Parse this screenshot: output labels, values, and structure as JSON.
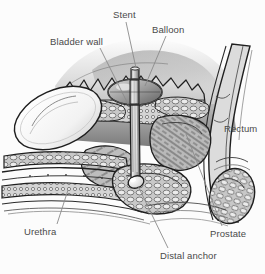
{
  "figure": {
    "background_color": "#fcfcfc",
    "ink_color": "#2b2b2b",
    "label_color": "#4a4a4a",
    "leader_color": "#8a8a8a"
  },
  "labels": {
    "stent": "Stent",
    "balloon": "Balloon",
    "bladder_wall": "Bladder wall",
    "rectum": "Rectum",
    "urethra": "Urethra",
    "prostate": "Prostate",
    "distal_anchor": "Distal anchor"
  },
  "structures": [
    {
      "name": "bladder-wall",
      "label": "Bladder wall"
    },
    {
      "name": "stent",
      "label": "Stent"
    },
    {
      "name": "balloon",
      "label": "Balloon"
    },
    {
      "name": "rectum",
      "label": "Rectum"
    },
    {
      "name": "prostate",
      "label": "Prostate"
    },
    {
      "name": "urethra",
      "label": "Urethra"
    },
    {
      "name": "distal-anchor",
      "label": "Distal anchor"
    },
    {
      "name": "pubic-symphysis",
      "label": ""
    }
  ]
}
